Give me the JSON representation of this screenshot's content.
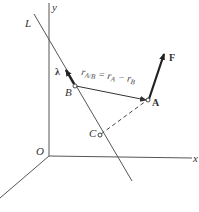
{
  "diagram": {
    "axes": {
      "x": "x",
      "y": "y",
      "origin": "O"
    },
    "line_label": "L",
    "points": {
      "A": "A",
      "B": "B",
      "C": "C"
    },
    "unit_vector": "λ",
    "force": "F",
    "relative_position": {
      "r": "r",
      "sub_AB": "A/B",
      "equals": " = r",
      "sub_A": "A",
      "minus": " − r",
      "sub_B": "B"
    },
    "colors": {
      "line": "#555555",
      "arrow": "#222222",
      "text": "#333333"
    }
  }
}
